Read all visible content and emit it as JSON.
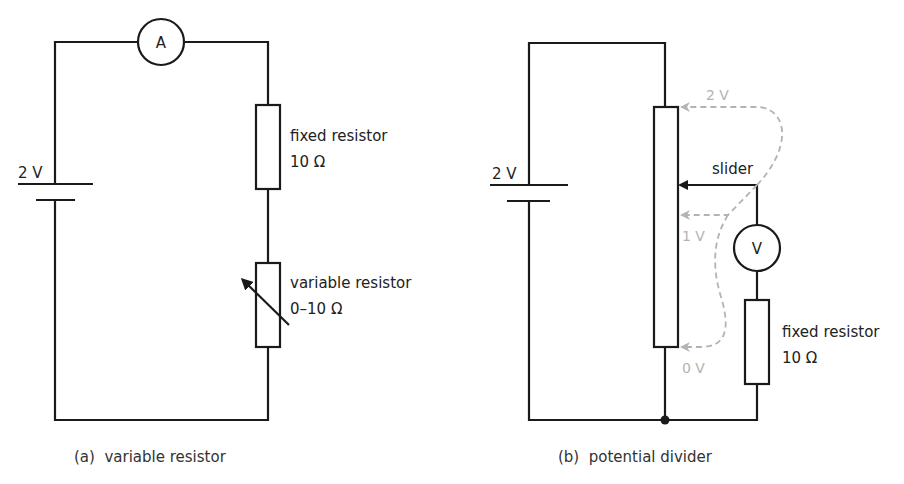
{
  "figure_a": {
    "caption": "(a)  variable resistor",
    "battery_label": "2 V",
    "ammeter_symbol": "A",
    "fixed_resistor": {
      "label": "fixed resistor",
      "value": "10 Ω"
    },
    "variable_resistor": {
      "label": "variable resistor",
      "value": "0–10 Ω"
    }
  },
  "figure_b": {
    "caption": "(b)  potential divider",
    "battery_label": "2 V",
    "slider_label": "slider",
    "voltmeter_symbol": "V",
    "potential_markers": [
      "2 V",
      "1 V",
      "0 V"
    ],
    "fixed_resistor": {
      "label": "fixed resistor",
      "value": "10 Ω"
    }
  },
  "colors": {
    "line": "#1a1a1a",
    "annotation_gray": "#b3b3b3"
  }
}
